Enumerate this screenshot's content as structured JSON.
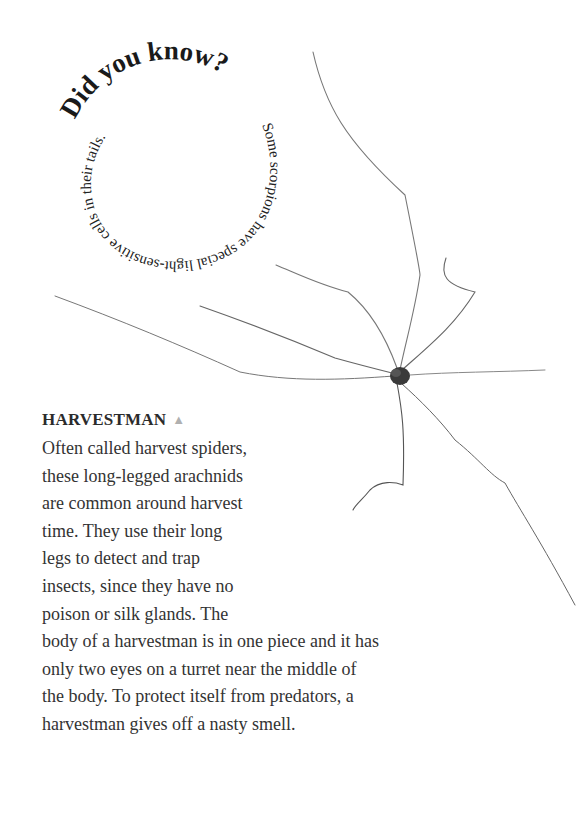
{
  "callout": {
    "title": "Did you know?",
    "text": "Some scorpions have special light-sensitive cells in their tails."
  },
  "article": {
    "heading": "HARVESTMAN",
    "heading_marker": "▲",
    "lines": [
      "Often called harvest spiders,",
      "these long-legged arachnids",
      "are common around harvest",
      "time. They use their long",
      "legs to detect and trap",
      "insects, since they have no",
      "poison or silk glands. The",
      "body of a harvestman is in one piece and it has",
      "only two eyes on a turret near the middle of",
      "the body. To protect itself from predators, a",
      "harvestman gives off a nasty smell."
    ]
  },
  "image": {
    "subject": "harvestman-illustration"
  }
}
